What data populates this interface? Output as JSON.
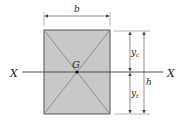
{
  "diagram": {
    "labels": {
      "width": "b",
      "height": "h",
      "centroid": "G",
      "axis_left": "X",
      "axis_right": "X",
      "y_compression": "y",
      "y_compression_sub": "c",
      "y_tension": "y",
      "y_tension_sub": "t"
    },
    "colors": {
      "section_fill": "#c8c8c8",
      "section_stroke": "#555555",
      "lines": "#444444"
    }
  }
}
